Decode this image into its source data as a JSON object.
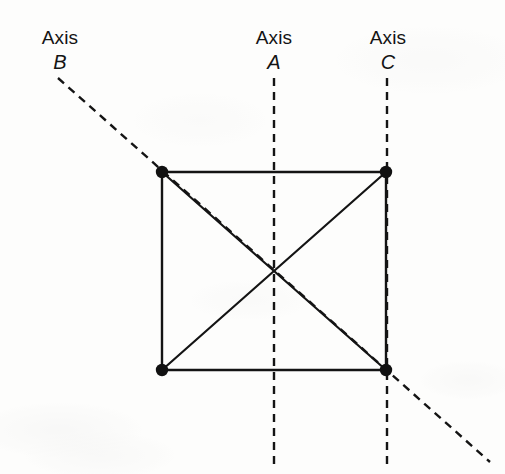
{
  "figure": {
    "type": "geometry-diagram",
    "colors": {
      "ink": "#141414",
      "background": "#fdfdfc",
      "vertex": "#111111"
    },
    "labels": [
      {
        "id": "axis-b",
        "word": "Axis",
        "letter": "B"
      },
      {
        "id": "axis-a",
        "word": "Axis",
        "letter": "A"
      },
      {
        "id": "axis-c",
        "word": "Axis",
        "letter": "C"
      }
    ],
    "shape": {
      "name": "square",
      "vertices": [
        {
          "id": "top-left",
          "x": 162,
          "y": 172
        },
        {
          "id": "top-right",
          "x": 386,
          "y": 172
        },
        {
          "id": "bottom-right",
          "x": 386,
          "y": 370
        },
        {
          "id": "bottom-left",
          "x": 162,
          "y": 370
        }
      ],
      "edges": [
        {
          "from": "top-left",
          "to": "top-right"
        },
        {
          "from": "top-right",
          "to": "bottom-right"
        },
        {
          "from": "bottom-right",
          "to": "bottom-left"
        },
        {
          "from": "bottom-left",
          "to": "top-left"
        }
      ],
      "diagonals": [
        {
          "from": "top-left",
          "to": "bottom-right"
        },
        {
          "from": "top-right",
          "to": "bottom-left"
        }
      ],
      "center": {
        "x": 274,
        "y": 271
      },
      "vertex_dot_radius": 6,
      "stroke_width": 2
    },
    "axes": [
      {
        "id": "axis-a",
        "orientation": "vertical",
        "style": "dashed",
        "x1": 274,
        "y1": 78,
        "x2": 274,
        "y2": 470
      },
      {
        "id": "axis-c",
        "orientation": "vertical",
        "style": "dashed",
        "x1": 387,
        "y1": 78,
        "x2": 387,
        "y2": 470
      },
      {
        "id": "axis-b",
        "orientation": "diagonal",
        "style": "dashed",
        "x1": 58,
        "y1": 78,
        "x2": 490,
        "y2": 462
      }
    ],
    "dash_pattern": "7 5"
  }
}
